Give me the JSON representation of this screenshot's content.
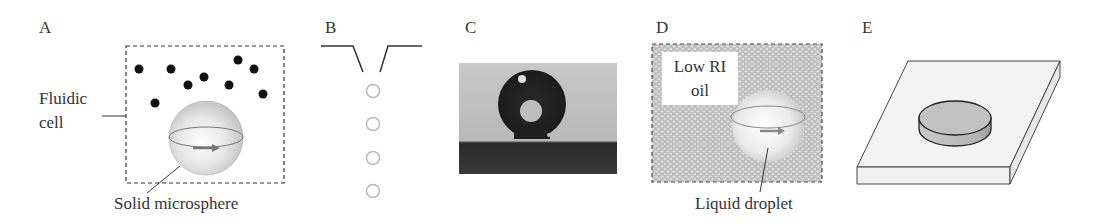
{
  "figure": {
    "panels": [
      {
        "letter": "A",
        "labels": {
          "cell_line1": "Fluidic",
          "cell_line2": "cell",
          "sphere": "Solid microsphere"
        }
      },
      {
        "letter": "B"
      },
      {
        "letter": "C"
      },
      {
        "letter": "D",
        "labels": {
          "oil_line1": "Low RI",
          "oil_line2": "oil",
          "droplet": "Liquid droplet"
        }
      },
      {
        "letter": "E"
      }
    ]
  }
}
